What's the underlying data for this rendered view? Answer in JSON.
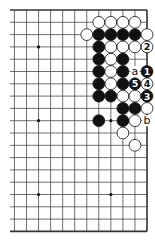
{
  "diagram": {
    "type": "go-problem",
    "board": {
      "rows": 19,
      "visible_columns": 13,
      "edges": [
        "top",
        "right",
        "bottom"
      ],
      "star_points": [
        [
          3,
          9
        ],
        [
          9,
          9
        ],
        [
          15,
          9
        ],
        [
          9,
          3
        ],
        [
          15,
          3
        ]
      ],
      "line_color": "#333333",
      "background": "#ffffff"
    },
    "stones": [
      {
        "r": 1,
        "c": 4,
        "color": "white"
      },
      {
        "r": 1,
        "c": 3,
        "color": "white"
      },
      {
        "r": 1,
        "c": 2,
        "color": "white"
      },
      {
        "r": 1,
        "c": 1,
        "color": "white"
      },
      {
        "r": 2,
        "c": 5,
        "color": "white"
      },
      {
        "r": 2,
        "c": 4,
        "color": "black"
      },
      {
        "r": 2,
        "c": 3,
        "color": "black"
      },
      {
        "r": 2,
        "c": 2,
        "color": "black"
      },
      {
        "r": 2,
        "c": 1,
        "color": "black"
      },
      {
        "r": 2,
        "c": 0,
        "color": "white"
      },
      {
        "r": 3,
        "c": 4,
        "color": "black"
      },
      {
        "r": 3,
        "c": 3,
        "color": "white"
      },
      {
        "r": 3,
        "c": 2,
        "color": "white"
      },
      {
        "r": 3,
        "c": 1,
        "color": "white"
      },
      {
        "r": 3,
        "c": 0,
        "color": "white",
        "label": "2"
      },
      {
        "r": 4,
        "c": 4,
        "color": "black"
      },
      {
        "r": 4,
        "c": 3,
        "color": "white"
      },
      {
        "r": 4,
        "c": 2,
        "color": "black"
      },
      {
        "r": 5,
        "c": 4,
        "color": "black"
      },
      {
        "r": 5,
        "c": 3,
        "color": "white"
      },
      {
        "r": 5,
        "c": 2,
        "color": "black"
      },
      {
        "r": 5,
        "c": 0,
        "color": "black",
        "label": "1"
      },
      {
        "r": 6,
        "c": 4,
        "color": "black"
      },
      {
        "r": 6,
        "c": 3,
        "color": "white"
      },
      {
        "r": 6,
        "c": 2,
        "color": "black"
      },
      {
        "r": 6,
        "c": 1,
        "color": "black",
        "label": "5"
      },
      {
        "r": 6,
        "c": 0,
        "color": "white",
        "label": "4"
      },
      {
        "r": 7,
        "c": 4,
        "color": "black"
      },
      {
        "r": 7,
        "c": 3,
        "color": "black"
      },
      {
        "r": 7,
        "c": 2,
        "color": "white"
      },
      {
        "r": 7,
        "c": 1,
        "color": "white"
      },
      {
        "r": 7,
        "c": 0,
        "color": "black",
        "label": "3"
      },
      {
        "r": 8,
        "c": 2,
        "color": "black"
      },
      {
        "r": 8,
        "c": 1,
        "color": "black"
      },
      {
        "r": 8,
        "c": 0,
        "color": "white"
      },
      {
        "r": 9,
        "c": 4,
        "color": "black"
      },
      {
        "r": 9,
        "c": 2,
        "color": "black"
      },
      {
        "r": 9,
        "c": 1,
        "color": "white"
      },
      {
        "r": 10,
        "c": 2,
        "color": "white"
      },
      {
        "r": 11,
        "c": 1,
        "color": "white"
      }
    ],
    "point_labels": [
      {
        "r": 5,
        "c": 1,
        "text": "a"
      },
      {
        "r": 9,
        "c": 0,
        "text": "b"
      }
    ]
  }
}
